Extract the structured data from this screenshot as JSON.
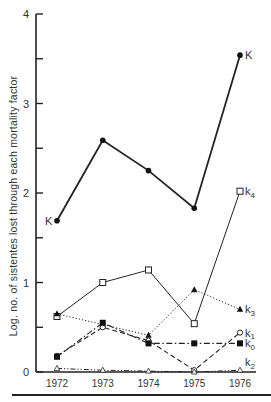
{
  "chart_data": {
    "type": "line",
    "title": "",
    "xlabel": "",
    "ylabel": "Log. no. of sistentes lost through each mortality factor",
    "ylim": [
      0,
      4
    ],
    "yticks": [
      0,
      0.5,
      1,
      1.5,
      2,
      2.5,
      3,
      3.5,
      4
    ],
    "ytick_labels": [
      "0",
      "",
      "1",
      "",
      "2",
      "",
      "3",
      "",
      "4"
    ],
    "grid": false,
    "legend_position": "inline labels at right end of each series",
    "categories": [
      "1972",
      "1973",
      "1974",
      "1975",
      "1976"
    ],
    "series": [
      {
        "name": "K",
        "label_1972": "K",
        "marker": "filled-circle",
        "line": "solid-thick",
        "values": [
          1.69,
          2.59,
          2.25,
          1.83,
          3.54
        ]
      },
      {
        "name": "k4",
        "marker": "open-square",
        "line": "solid-thin",
        "values": [
          0.62,
          1.0,
          1.14,
          0.54,
          2.02
        ]
      },
      {
        "name": "k3",
        "marker": "filled-triangle",
        "line": "dotted",
        "values": [
          0.65,
          0.53,
          0.41,
          0.92,
          0.7
        ]
      },
      {
        "name": "k1",
        "marker": "open-circle",
        "line": "dashed",
        "values": [
          0.18,
          0.5,
          0.35,
          0.02,
          0.44
        ]
      },
      {
        "name": "k0",
        "marker": "filled-square",
        "line": "dash-dot",
        "values": [
          0.17,
          0.55,
          0.32,
          0.32,
          0.32
        ]
      },
      {
        "name": "k2",
        "marker": "open-triangle",
        "line": "dash-dot-dot",
        "values": [
          0.04,
          0.02,
          0.01,
          0.0,
          0.02
        ]
      }
    ]
  },
  "labels": {
    "ylabel": "Log. no. of sistentes lost through each mortality factor"
  }
}
